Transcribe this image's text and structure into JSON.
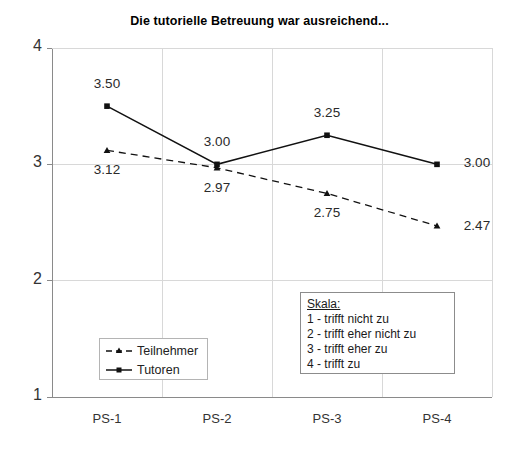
{
  "chart_data": {
    "type": "line",
    "title": "Die tutorielle Betreuung war ausreichend...",
    "xlabel": "",
    "ylabel": "",
    "categories": [
      "PS-1",
      "PS-2",
      "PS-3",
      "PS-4"
    ],
    "ylim": [
      1,
      4
    ],
    "yticks": [
      "1",
      "2",
      "3",
      "4"
    ],
    "grid": true,
    "legend_position": "lower-left-inside",
    "series": [
      {
        "name": "Tutoren",
        "values": [
          3.5,
          3.0,
          3.25,
          3.0
        ],
        "labels": [
          "3.50",
          "3.00",
          "3.25",
          "3.00"
        ],
        "line_style": "solid",
        "marker": "square",
        "color": "#111111"
      },
      {
        "name": "Teilnehmer",
        "values": [
          3.12,
          2.97,
          2.75,
          2.47
        ],
        "labels": [
          "3.12",
          "2.97",
          "2.75",
          "2.47"
        ],
        "line_style": "dashed",
        "marker": "triangle",
        "color": "#111111"
      }
    ],
    "annotations": {
      "scale_box": {
        "heading": "Skala:",
        "items": [
          "1 - trifft nicht zu",
          "2 - trifft eher nicht zu",
          "3 - trifft eher zu",
          "4 - trifft zu"
        ]
      }
    }
  }
}
